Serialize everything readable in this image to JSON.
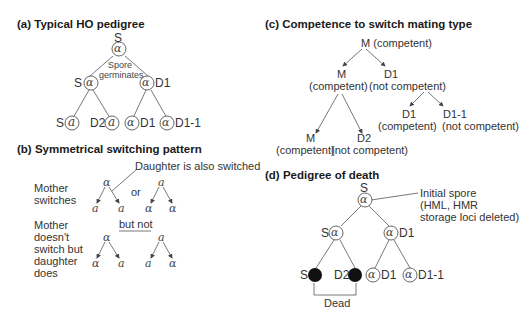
{
  "panels": {
    "a": {
      "title": "(a)  Typical HO pedigree",
      "root_label": "S",
      "root_type": "α",
      "annotation_line1": "Spore",
      "annotation_line2": "germinates",
      "level1": [
        {
          "label": "S",
          "type": "α"
        },
        {
          "label": "D1",
          "type": "α"
        }
      ],
      "level2": [
        {
          "label": "S",
          "type": "a"
        },
        {
          "label": "D2",
          "type": "a"
        },
        {
          "label": "D1",
          "type": "α"
        },
        {
          "label": "D1-1",
          "type": "α"
        }
      ]
    },
    "b": {
      "title": "(b)  Symmetrical switching pattern",
      "callout": "Daughter is also switched",
      "row1_label": [
        "Mother",
        "switches"
      ],
      "row2_label": [
        "Mother",
        "doesn't",
        "switch but",
        "daughter",
        "does"
      ],
      "or_label": "or",
      "but_not_label": "but not",
      "row1_trees": [
        {
          "parent": "α",
          "children": [
            "a",
            "a"
          ]
        },
        {
          "parent": "a",
          "children": [
            "α",
            "α"
          ]
        }
      ],
      "row2_trees": [
        {
          "parent": "α",
          "children": [
            "α",
            "a"
          ]
        },
        {
          "parent": "a",
          "children": [
            "a",
            "α"
          ]
        }
      ]
    },
    "c": {
      "title": "(c)  Competence to switch mating type",
      "root": {
        "name": "M",
        "status": "(competent)"
      },
      "level1": [
        {
          "name": "M",
          "status": "(competent)"
        },
        {
          "name": "D1",
          "status": "(not competent)"
        }
      ],
      "level2_left": [
        {
          "name": "M",
          "status": "(competent)"
        },
        {
          "name": "D2",
          "status": "(not competent)"
        }
      ],
      "level2_right": [
        {
          "name": "D1",
          "status": "(competent)"
        },
        {
          "name": "D1-1",
          "status": "(not competent)"
        }
      ]
    },
    "d": {
      "title": "(d)  Pedigree of death",
      "root_label": "S",
      "root_type": "α",
      "callout": [
        "Initial spore",
        "(HML, HMR",
        "storage loci deleted)"
      ],
      "level1": [
        {
          "label": "S",
          "type": "α"
        },
        {
          "label": "D1",
          "type": "α"
        }
      ],
      "level2": [
        {
          "label": "S",
          "type": "dead"
        },
        {
          "label": "D2",
          "type": "dead"
        },
        {
          "label": "D1",
          "type": "α"
        },
        {
          "label": "D1-1",
          "type": "α"
        }
      ],
      "dead_label": "Dead"
    }
  }
}
